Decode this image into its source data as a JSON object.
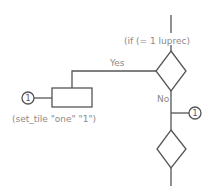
{
  "diagram": {
    "type": "flowchart",
    "colors": {
      "line": "#555555",
      "text": "#8a8a8a",
      "background": "#ffffff"
    },
    "decision1": {
      "label": "(if (= 1 luprec)"
    },
    "yes_branch": {
      "label": "Yes"
    },
    "no_branch": {
      "label": "No"
    },
    "process1": {
      "label": "(set_tile \"one\" \"1\")"
    },
    "connector_left": {
      "label": "1"
    },
    "connector_right": {
      "label": "1"
    },
    "decision2": {
      "label": ""
    }
  }
}
